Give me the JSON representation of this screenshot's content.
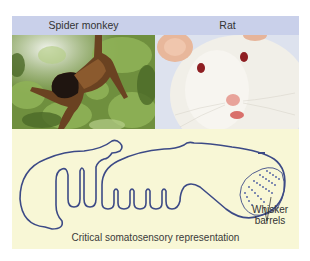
{
  "header": {
    "left_label": "Spider monkey",
    "right_label": "Rat",
    "background": "#c9d0ea"
  },
  "photos": {
    "left": {
      "subject": "spider monkey hanging in green foliage"
    },
    "right": {
      "subject": "white laboratory rat face close-up"
    }
  },
  "panel": {
    "background": "#f8f7d6",
    "outline_color": "#3c4a86",
    "caption": "Critical somatosensory representation",
    "annotation_line1": "Whisker",
    "annotation_line2": "barrels"
  }
}
